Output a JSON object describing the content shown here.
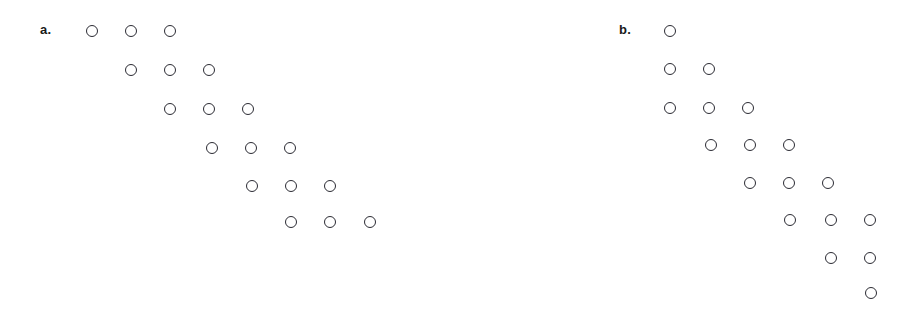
{
  "figure": {
    "background_color": "#ffffff",
    "circle_stroke_color": "#2b2b33",
    "circle_diameter_px": 12,
    "width_px": 911,
    "height_px": 317
  },
  "panels": [
    {
      "id": "panel-a",
      "label": "a.",
      "label_x": 40,
      "label_y": 23,
      "shape_description": "six rows of three circles forming a descending staircase",
      "row_count": 6,
      "circle_count": 18,
      "rows": [
        {
          "index": 1,
          "y": 25,
          "count": 3,
          "x": [
            86,
            125,
            164
          ]
        },
        {
          "index": 2,
          "y": 64,
          "count": 3,
          "x": [
            125,
            164,
            203
          ]
        },
        {
          "index": 3,
          "y": 103,
          "count": 3,
          "x": [
            164,
            203,
            242
          ]
        },
        {
          "index": 4,
          "y": 142,
          "count": 3,
          "x": [
            206,
            245,
            284
          ]
        },
        {
          "index": 5,
          "y": 180,
          "count": 3,
          "x": [
            246,
            285,
            324
          ]
        },
        {
          "index": 6,
          "y": 216,
          "count": 3,
          "x": [
            285,
            324,
            364
          ]
        }
      ]
    },
    {
      "id": "panel-b",
      "label": "b.",
      "label_x": 619,
      "label_y": 23,
      "shape_description": "eight rows forming a diagonal band that widens then narrows",
      "row_count": 8,
      "circle_count": 18,
      "rows": [
        {
          "index": 1,
          "y": 25,
          "count": 1,
          "x": [
            664
          ]
        },
        {
          "index": 2,
          "y": 63,
          "count": 2,
          "x": [
            664,
            703
          ]
        },
        {
          "index": 3,
          "y": 102,
          "count": 3,
          "x": [
            664,
            703,
            742
          ]
        },
        {
          "index": 4,
          "y": 139,
          "count": 3,
          "x": [
            705,
            744,
            783
          ]
        },
        {
          "index": 5,
          "y": 177,
          "count": 3,
          "x": [
            744,
            783,
            822
          ]
        },
        {
          "index": 6,
          "y": 214,
          "count": 3,
          "x": [
            784,
            825,
            864
          ]
        },
        {
          "index": 7,
          "y": 252,
          "count": 2,
          "x": [
            825,
            864
          ]
        },
        {
          "index": 8,
          "y": 287,
          "count": 1,
          "x": [
            865
          ]
        }
      ]
    }
  ]
}
